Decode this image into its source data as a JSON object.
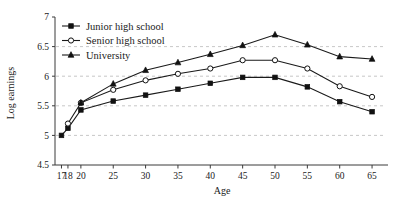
{
  "chart_data": {
    "type": "line",
    "title": "",
    "xlabel": "Age",
    "ylabel": "Log earnings",
    "xlim": [
      16,
      67
    ],
    "ylim": [
      4.5,
      7
    ],
    "grid": true,
    "legend_position": "top-left",
    "x_ticks": [
      "17",
      "18",
      "20",
      "25",
      "30",
      "35",
      "40",
      "45",
      "50",
      "55",
      "60",
      "65"
    ],
    "x_tick_values": [
      17,
      18,
      20,
      25,
      30,
      35,
      40,
      45,
      50,
      55,
      60,
      65
    ],
    "y_ticks": [
      "4.5",
      "5",
      "5.5",
      "6",
      "6.5",
      "7"
    ],
    "y_tick_values": [
      4.5,
      5,
      5.5,
      6,
      6.5,
      7
    ],
    "series": [
      {
        "name": "Junior high school",
        "marker": "filled-square",
        "x": [
          17,
          18,
          20,
          25,
          30,
          35,
          40,
          45,
          50,
          55,
          60,
          65
        ],
        "values": [
          5.0,
          5.12,
          5.43,
          5.58,
          5.68,
          5.78,
          5.88,
          5.98,
          5.98,
          5.82,
          5.57,
          5.4
        ]
      },
      {
        "name": "Senior high school",
        "marker": "open-circle",
        "x": [
          18,
          20,
          25,
          30,
          35,
          40,
          45,
          50,
          55,
          60,
          65
        ],
        "values": [
          5.2,
          5.55,
          5.77,
          5.93,
          6.04,
          6.13,
          6.27,
          6.27,
          6.13,
          5.83,
          5.65
        ]
      },
      {
        "name": "University",
        "marker": "filled-triangle",
        "x": [
          20,
          25,
          30,
          35,
          40,
          45,
          50,
          55,
          60,
          65
        ],
        "values": [
          5.55,
          5.87,
          6.1,
          6.23,
          6.37,
          6.52,
          6.7,
          6.53,
          6.33,
          6.29
        ]
      }
    ]
  },
  "legend": {
    "items": [
      {
        "label": "Junior high school"
      },
      {
        "label": "Senior high school"
      },
      {
        "label": "University"
      }
    ]
  },
  "axes": {
    "x_title": "Age",
    "y_title": "Log earnings"
  }
}
